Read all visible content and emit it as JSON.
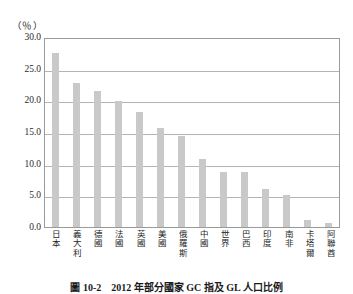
{
  "chart_data": {
    "type": "bar",
    "title": "",
    "caption": "圖 10-2　2012 年部分國家 GC 指及 GL 人口比例",
    "unit_label": "（％）",
    "xlabel": "",
    "ylabel": "",
    "ylim": [
      0.0,
      30.0
    ],
    "ytick_step": 5.0,
    "yticks": [
      "30.0",
      "25.0",
      "20.0",
      "15.0",
      "10.0",
      "5.0",
      "0.0"
    ],
    "ytick_values": [
      30.0,
      25.0,
      20.0,
      15.0,
      10.0,
      5.0,
      0.0
    ],
    "grid": true,
    "grid_axis": "y",
    "legend": "none",
    "bar_color": "#c9c9c9",
    "grid_color": "#b4b4b4",
    "frame_color": "#9a9a9a",
    "categories": [
      "日本",
      "義大利",
      "德國",
      "法國",
      "英國",
      "美國",
      "俄羅斯",
      "中國",
      "世界",
      "巴西",
      "印度",
      "南非",
      "卡塔爾",
      "阿聯酋"
    ],
    "values": [
      27.5,
      22.7,
      21.4,
      19.9,
      18.2,
      15.6,
      14.4,
      10.7,
      8.7,
      8.7,
      6.0,
      5.1,
      1.1,
      0.7
    ]
  }
}
